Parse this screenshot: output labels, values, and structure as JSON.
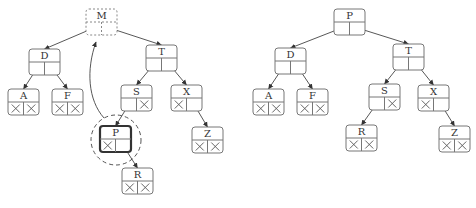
{
  "diagram": {
    "left_tree": {
      "nodes": [
        {
          "id": "M",
          "label": "M",
          "x": 86,
          "y": 9,
          "style": "dashed",
          "left": "D",
          "right": "T"
        },
        {
          "id": "D",
          "label": "D",
          "x": 29,
          "y": 49,
          "left": "A",
          "right": "F"
        },
        {
          "id": "A",
          "label": "A",
          "x": 8,
          "y": 89,
          "left": null,
          "right": null
        },
        {
          "id": "F",
          "label": "F",
          "x": 52,
          "y": 89,
          "left": null,
          "right": null
        },
        {
          "id": "T",
          "label": "T",
          "x": 146,
          "y": 45,
          "left": "S",
          "right": "X"
        },
        {
          "id": "S",
          "label": "S",
          "x": 121,
          "y": 85,
          "left": "P",
          "right": null
        },
        {
          "id": "X",
          "label": "X",
          "x": 171,
          "y": 85,
          "left": null,
          "right": "Z"
        },
        {
          "id": "P",
          "label": "P",
          "x": 100,
          "y": 126,
          "style": "bold",
          "left": null,
          "right": "R"
        },
        {
          "id": "R",
          "label": "R",
          "x": 122,
          "y": 168,
          "left": null,
          "right": null
        },
        {
          "id": "Z",
          "label": "Z",
          "x": 192,
          "y": 127,
          "left": null,
          "right": null
        }
      ],
      "highlight_circle": {
        "cx": 116,
        "cy": 140,
        "r": 25
      },
      "move_arrow": {
        "from": "P",
        "to": "M"
      }
    },
    "right_tree": {
      "nodes": [
        {
          "id": "P",
          "label": "P",
          "x": 334,
          "y": 9,
          "left": "D",
          "right": "T"
        },
        {
          "id": "D",
          "label": "D",
          "x": 275,
          "y": 48,
          "left": "A",
          "right": "F"
        },
        {
          "id": "A",
          "label": "A",
          "x": 253,
          "y": 89,
          "left": null,
          "right": null
        },
        {
          "id": "F",
          "label": "F",
          "x": 297,
          "y": 89,
          "left": null,
          "right": null
        },
        {
          "id": "T",
          "label": "T",
          "x": 393,
          "y": 44,
          "left": "S",
          "right": "X"
        },
        {
          "id": "S",
          "label": "S",
          "x": 369,
          "y": 84,
          "left": "R",
          "right": null
        },
        {
          "id": "X",
          "label": "X",
          "x": 418,
          "y": 85,
          "left": null,
          "right": "Z"
        },
        {
          "id": "R",
          "label": "R",
          "x": 346,
          "y": 125,
          "left": null,
          "right": null
        },
        {
          "id": "Z",
          "label": "Z",
          "x": 439,
          "y": 126,
          "left": null,
          "right": null
        }
      ]
    },
    "node_size": {
      "w": 31,
      "h": 26
    },
    "null_symbol": "×"
  }
}
